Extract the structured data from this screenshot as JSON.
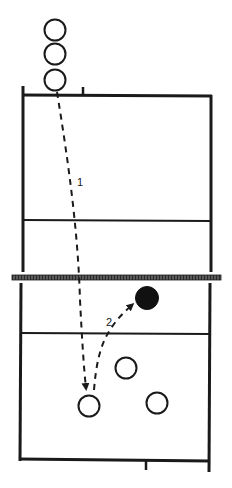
{
  "diagram": {
    "type": "volleyball-court-play",
    "colors": {
      "line": "#1a1a1a",
      "background": "#ffffff",
      "player_fill_open": "#ffffff",
      "player_fill_solid": "#111111"
    },
    "paths": [
      {
        "id": 1,
        "label": "1",
        "from": "top-baseline-player",
        "to": "bottom-left-player"
      },
      {
        "id": 2,
        "label": "2",
        "from": "bottom-left-player",
        "to": "solid-player-near-net"
      }
    ],
    "players": {
      "queued_top": 3,
      "bottom_open": 3,
      "solid": 1
    }
  }
}
